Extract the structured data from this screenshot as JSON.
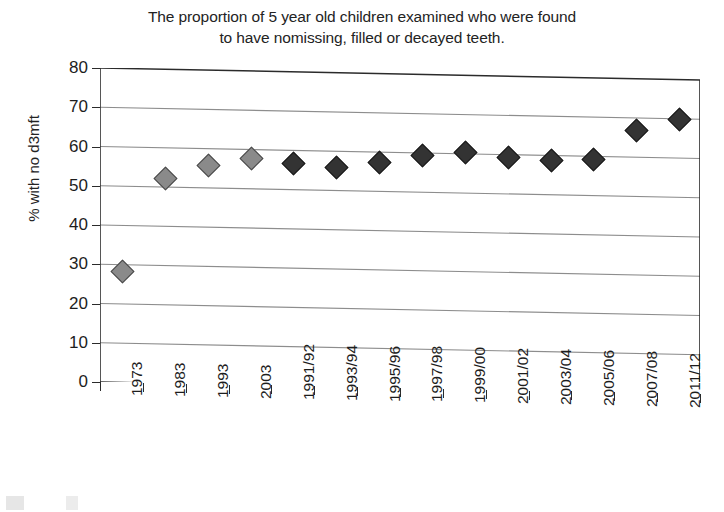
{
  "chart_data": {
    "type": "scatter",
    "title": "The proportion of 5 year old children examined who were found to have nomissing, filled or decayed teeth.",
    "title_line1": "The proportion of 5 year old children examined who were found",
    "title_line2": "to have nomissing, filled or decayed teeth.",
    "xlabel": "",
    "ylabel": "% with no d3mft",
    "ylim": [
      0,
      80
    ],
    "ytick_step": 10,
    "yticks": [
      "0",
      "10",
      "20",
      "30",
      "40",
      "50",
      "60",
      "70",
      "80"
    ],
    "grid": true,
    "grid_axis": "y",
    "legend": "none",
    "categories": [
      "1973",
      "1983",
      "1993",
      "2003",
      "1991/92",
      "1993/94",
      "1995/96",
      "1997/98",
      "1999/00",
      "2001/02",
      "2003/04",
      "2005/06",
      "2007/08",
      "2011/12"
    ],
    "values": [
      28.5,
      52.5,
      56.0,
      58.0,
      57.0,
      56.0,
      57.5,
      59.5,
      60.5,
      59.5,
      59.0,
      59.5,
      67.0,
      70.0
    ],
    "series": [
      {
        "name": "decennial surveys",
        "color": "#8a8a8a",
        "marker": "diamond",
        "points": [
          {
            "category": "1973",
            "value": 28.5
          },
          {
            "category": "1983",
            "value": 52.5
          },
          {
            "category": "1993",
            "value": 56.0
          },
          {
            "category": "2003",
            "value": 58.0
          }
        ]
      },
      {
        "name": "biennial surveys",
        "color": "#333333",
        "marker": "diamond",
        "points": [
          {
            "category": "1991/92",
            "value": 57.0
          },
          {
            "category": "1993/94",
            "value": 56.0
          },
          {
            "category": "1995/96",
            "value": 57.5
          },
          {
            "category": "1997/98",
            "value": 59.5
          },
          {
            "category": "1999/00",
            "value": 60.5
          },
          {
            "category": "2001/02",
            "value": 59.5
          },
          {
            "category": "2003/04",
            "value": 59.0
          },
          {
            "category": "2005/06",
            "value": 59.5
          },
          {
            "category": "2007/08",
            "value": 67.0
          },
          {
            "category": "2011/12",
            "value": 70.0
          }
        ]
      }
    ]
  },
  "figure": {
    "axis_color": "#2b2b2b",
    "grid_color": "#8d8d8d",
    "background": "#ffffff"
  }
}
